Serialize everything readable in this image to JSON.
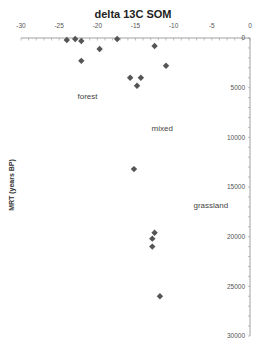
{
  "chart_data": {
    "type": "scatter",
    "title": "delta 13C SOM",
    "xlabel": "",
    "ylabel": "MRT (years BP)",
    "xlim": [
      -30,
      0
    ],
    "ylim": [
      0,
      30000
    ],
    "y_inverted": true,
    "x_axis_position": "top",
    "y_axis_position": "right",
    "x_ticks": [
      -30,
      -25,
      -20,
      -15,
      -10,
      -5,
      0
    ],
    "y_ticks": [
      0,
      5000,
      10000,
      15000,
      20000,
      25000,
      30000
    ],
    "x_tick_labels": [
      "-30",
      "-25",
      "-20",
      "-15",
      "-10",
      "-5",
      "0"
    ],
    "y_tick_labels": [
      "0",
      "5000",
      "10000",
      "15000",
      "20000",
      "25000",
      "30000"
    ],
    "grid": false,
    "marker": "diamond",
    "marker_color": "#555555",
    "series": [
      {
        "name": "samples",
        "points": [
          {
            "x": -24.0,
            "y": 200
          },
          {
            "x": -22.9,
            "y": 100
          },
          {
            "x": -22.1,
            "y": 300
          },
          {
            "x": -22.1,
            "y": 2300
          },
          {
            "x": -19.7,
            "y": 1100
          },
          {
            "x": -17.4,
            "y": 100
          },
          {
            "x": -12.5,
            "y": 800
          },
          {
            "x": -11.0,
            "y": 2800
          },
          {
            "x": -15.7,
            "y": 4000
          },
          {
            "x": -14.3,
            "y": 4000
          },
          {
            "x": -14.8,
            "y": 4800
          },
          {
            "x": -15.2,
            "y": 13200
          },
          {
            "x": -12.5,
            "y": 19600
          },
          {
            "x": -12.8,
            "y": 20200
          },
          {
            "x": -12.8,
            "y": 21000
          },
          {
            "x": -11.8,
            "y": 26000
          }
        ]
      }
    ],
    "annotations": [
      {
        "text": "forest",
        "x": -22.6,
        "y": 6100
      },
      {
        "text": "mixed",
        "x": -12.9,
        "y": 9400
      },
      {
        "text": "grassland",
        "x": -7.4,
        "y": 17100
      }
    ]
  }
}
